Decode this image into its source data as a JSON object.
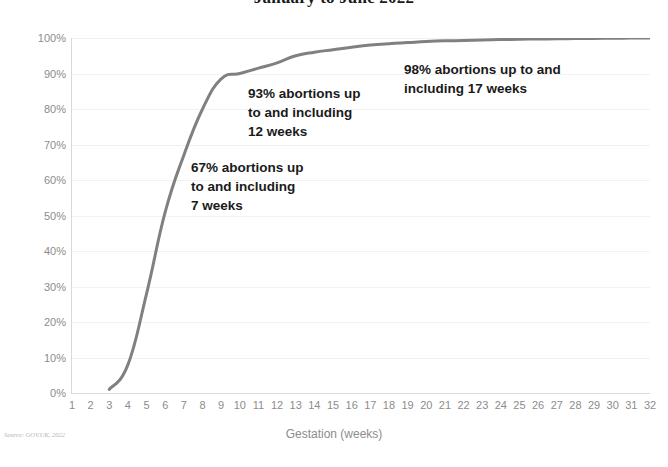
{
  "chart": {
    "title": "January to June 2022",
    "source_note": "Source: GOV.UK, 2022",
    "line_color": "#808080",
    "grid_color": "#f2f2f2",
    "tick_color": "#8c8c8c",
    "annotation_color": "#1a1a1a"
  },
  "annotations": [
    {
      "id": "a67",
      "text": "67% abortions up\nto and including\n7 weeks",
      "value": 67,
      "week": 7
    },
    {
      "id": "a93",
      "text": "93% abortions up\nto and including\n12 weeks",
      "value": 93,
      "week": 12
    },
    {
      "id": "a98",
      "text": "98% abortions up to and\nincluding 17 weeks",
      "value": 98,
      "week": 17
    }
  ],
  "chart_data": {
    "type": "line",
    "title": "January to June 2022",
    "xlabel": "Gestation (weeks)",
    "ylabel": "",
    "xlim": [
      1,
      32
    ],
    "ylim": [
      0,
      100
    ],
    "grid": true,
    "legend": false,
    "x_tick_labels": [
      "1",
      "2",
      "3",
      "4",
      "5",
      "6",
      "7",
      "8",
      "9",
      "10",
      "11",
      "12",
      "13",
      "14",
      "15",
      "16",
      "17",
      "18",
      "19",
      "20",
      "21",
      "22",
      "23",
      "24",
      "25",
      "26",
      "27",
      "28",
      "29",
      "30",
      "31",
      "32"
    ],
    "y_tick_labels": [
      "0%",
      "10%",
      "20%",
      "30%",
      "40%",
      "50%",
      "60%",
      "70%",
      "80%",
      "90%",
      "100%"
    ],
    "y_ticks": [
      0,
      10,
      20,
      30,
      40,
      50,
      60,
      70,
      80,
      90,
      100
    ],
    "series": [
      {
        "name": "Cumulative percentage of abortions",
        "x": [
          3,
          4,
          5,
          6,
          7,
          8,
          9,
          10,
          11,
          12,
          13,
          14,
          15,
          16,
          17,
          18,
          19,
          20,
          21,
          22,
          23,
          24,
          25,
          26,
          27,
          28,
          29,
          30,
          31,
          32
        ],
        "values": [
          1,
          8,
          28,
          51,
          67,
          80,
          88.5,
          90,
          91.5,
          93,
          95,
          96,
          96.7,
          97.4,
          98,
          98.4,
          98.7,
          99,
          99.2,
          99.3,
          99.45,
          99.55,
          99.65,
          99.72,
          99.78,
          99.84,
          99.89,
          99.93,
          99.97,
          100
        ]
      }
    ]
  }
}
